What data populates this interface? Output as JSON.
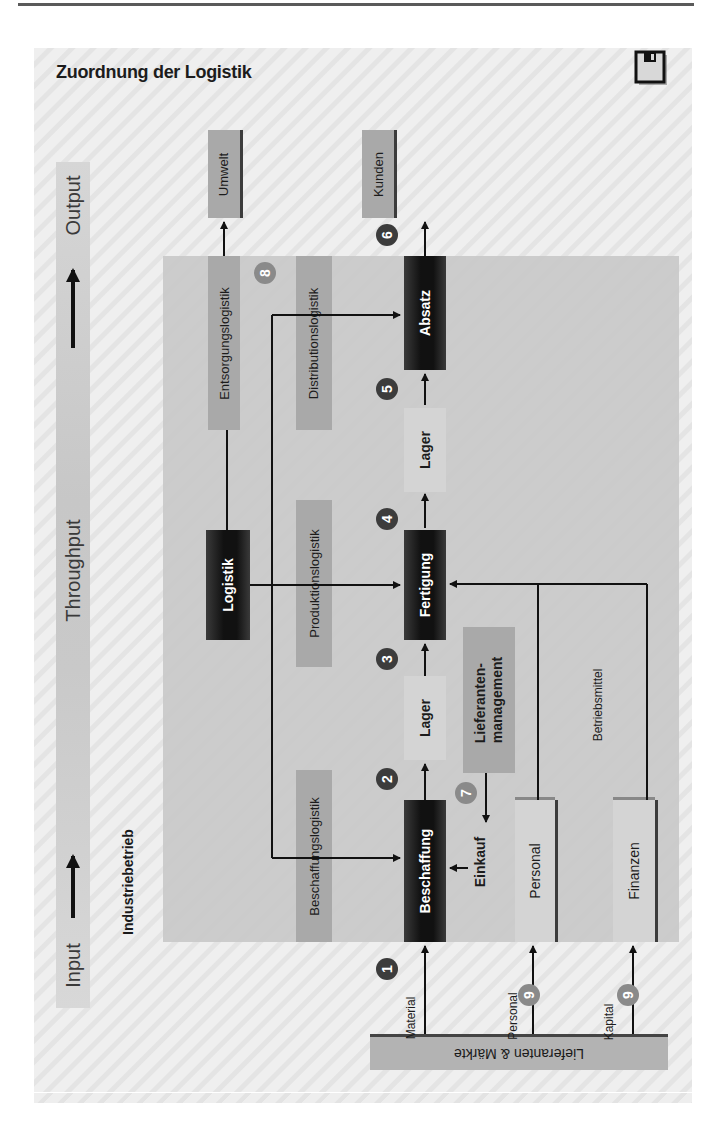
{
  "title": "Zuordnung der Logistik",
  "icons": {
    "save": "save-icon"
  },
  "flow": {
    "input": "Input",
    "throughput": "Throughput",
    "output": "Output"
  },
  "section_label": "Industriebetrieb",
  "outputs": {
    "environment": "Umwelt",
    "customers": "Kunden"
  },
  "logistics": {
    "center": "Logistik",
    "disposal": "Entsorgungslogistik",
    "distribution": "Distributionslogistik",
    "production": "Produktionslogistik",
    "procurement": "Beschaffungslogistik"
  },
  "process_chain": {
    "sales": "Absatz",
    "storage_upper": "Lager",
    "manufacturing": "Fertigung",
    "storage_lower": "Lager",
    "procurement": "Beschaffung"
  },
  "supplier_management": {
    "line1": "Lieferanten-",
    "line2": "management"
  },
  "purchasing": "Einkauf",
  "resources": {
    "personnel": "Personal",
    "finance": "Finanzen",
    "equipment_label": "Betriebsmittel"
  },
  "market": {
    "label": "Lieferanten & Märkte",
    "flows": {
      "material": "Material",
      "personnel": "Personal",
      "capital": "Kapital"
    }
  },
  "badges": {
    "b1": "1",
    "b2": "2",
    "b3": "3",
    "b4": "4",
    "b5": "5",
    "b6": "6",
    "b7": "7",
    "b8": "8",
    "b9a": "9",
    "b9b": "9"
  }
}
